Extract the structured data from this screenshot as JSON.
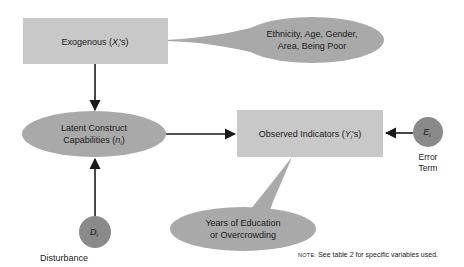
{
  "diagram": {
    "nodes": {
      "exogenous": {
        "text": "Exogenous (",
        "var": "X",
        "sub": "i",
        "suffix": "'s)"
      },
      "exogenous_callout": {
        "line1": "Ethnicity, Age, Gender,",
        "line2": "Area, Being Poor"
      },
      "latent": {
        "line1": "Latent Construct",
        "line2_text": "Capabilities (",
        "var": "n",
        "sub": "i",
        "suffix": ")"
      },
      "observed": {
        "text": "Observed Indicators (",
        "var": "Y",
        "sub": "i",
        "suffix": "'s)"
      },
      "observed_callout": {
        "line1": "Years of Education",
        "line2": "or Overcrowding"
      },
      "error": {
        "var": "E",
        "sub": "i",
        "label_line1": "Error",
        "label_line2": "Term"
      },
      "disturbance": {
        "var": "D",
        "sub": "i",
        "label": "Disturbance"
      }
    },
    "edges": [
      {
        "from": "exogenous",
        "to": "latent"
      },
      {
        "from": "latent",
        "to": "observed"
      },
      {
        "from": "error",
        "to": "observed"
      },
      {
        "from": "disturbance",
        "to": "latent"
      }
    ],
    "note": {
      "prefix": "NOTE:",
      "text": " See table 2 for specific variables used."
    }
  }
}
